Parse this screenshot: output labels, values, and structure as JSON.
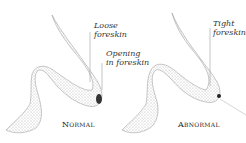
{
  "figure": {
    "panels": [
      {
        "caption": "Normal",
        "labels": [
          {
            "line1": "Loose",
            "line2": "foreskin"
          },
          {
            "line1": "Opening",
            "line2": "in foreskin"
          }
        ]
      },
      {
        "caption": "Abnormal",
        "labels": [
          {
            "line1": "Tight",
            "line2": "foreskin"
          }
        ]
      }
    ],
    "colors": {
      "stipple": "#555555",
      "leader_line": "#888888",
      "text": "#333333"
    }
  }
}
